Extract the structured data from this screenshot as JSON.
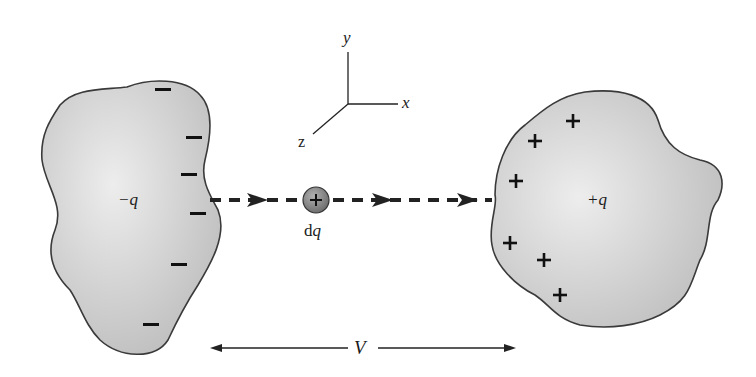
{
  "diagram": {
    "axes": {
      "x_label": "x",
      "y_label": "y",
      "z_label": "z"
    },
    "left_body": {
      "label": "−q",
      "charge_sign": "negative",
      "num_minus_signs": 7
    },
    "right_body": {
      "label": "+q",
      "charge_sign": "positive",
      "num_plus_signs": 7,
      "plus_glyph": "+"
    },
    "test_charge": {
      "label_d": "d",
      "label_q": "q",
      "glyph": "+"
    },
    "potential": {
      "label": "V"
    },
    "colors": {
      "body_fill": "#c8c8c8",
      "body_highlight": "#ececec",
      "outline": "#3a3a3a",
      "path": "#222222",
      "charge_fill": "#8a8a8a"
    }
  }
}
